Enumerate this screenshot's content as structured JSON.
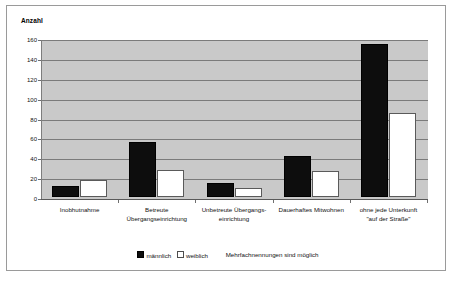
{
  "figure": {
    "axis_title": "Anzahl",
    "background_color": "#ffffff",
    "plot_background_color": "#c9c9c9",
    "border_color": "#9a9a9a"
  },
  "legend": {
    "male_label": "männlich",
    "female_label": "weiblich",
    "note": "Mehrfachnennungen sind möglich",
    "male_color": "#0d0d0d",
    "female_color": "#ffffff"
  },
  "chart_data": {
    "type": "bar",
    "title": "",
    "xlabel": "",
    "ylabel": "Anzahl",
    "ylim": [
      0,
      160
    ],
    "yticks": [
      0,
      20,
      40,
      60,
      80,
      100,
      120,
      140,
      160
    ],
    "grid": true,
    "legend_position": "bottom",
    "categories": [
      "Inobhutnahme",
      "Betreute\nÜbergangseinrichtung",
      "Unbetreute Übergangs-\neinrichtung",
      "Dauerhaftes Mitwohnen",
      "ohne jede Unterkunft\n\"auf der Straße\""
    ],
    "series": [
      {
        "name": "männlich",
        "values": [
          11,
          55,
          14,
          41,
          154
        ]
      },
      {
        "name": "weiblich",
        "values": [
          17,
          27,
          9,
          26,
          85
        ]
      }
    ],
    "annotations": [
      "Mehrfachnennungen sind möglich"
    ]
  }
}
